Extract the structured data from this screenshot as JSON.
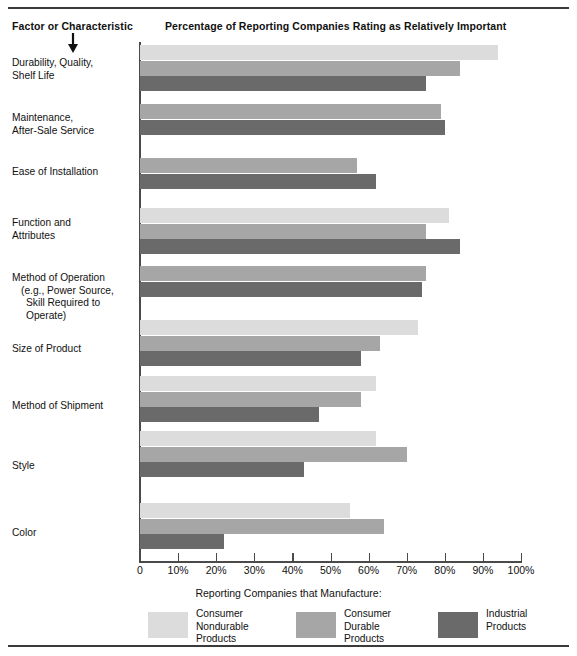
{
  "headers": {
    "factor": "Factor or Characteristic",
    "percentage": "Percentage of Reporting Companies Rating as Relatively Important"
  },
  "legend": {
    "title": "Reporting Companies that Manufacture:",
    "items": [
      {
        "label": "Consumer\nNondurable\nProducts",
        "color": "#dcdcdc",
        "key": "consumer-nondurable"
      },
      {
        "label": "Consumer\nDurable\nProducts",
        "color": "#a6a6a6",
        "key": "consumer-durable"
      },
      {
        "label": "Industrial\nProducts",
        "color": "#6a6a6a",
        "key": "industrial"
      }
    ]
  },
  "axis": {
    "ticks": [
      "0",
      "10%",
      "20%",
      "30%",
      "40%",
      "50%",
      "60%",
      "70%",
      "80%",
      "90%",
      "100%"
    ]
  },
  "chart_data": {
    "type": "bar",
    "orientation": "horizontal",
    "title": "Percentage of Reporting Companies Rating as Relatively Important",
    "xlabel": "Reporting Companies that Manufacture:",
    "ylabel": "Factor or Characteristic",
    "xlim": [
      0,
      100
    ],
    "grid": false,
    "legend_position": "bottom",
    "categories": [
      "Durability, Quality, Shelf Life",
      "Maintenance, After-Sale Service",
      "Ease of Installation",
      "Function and Attributes",
      "Method of Operation (e.g., Power Source, Skill Required to Operate)",
      "Size of Product",
      "Method of Shipment",
      "Style",
      "Color"
    ],
    "category_lines": [
      [
        "Durability, Quality,",
        "Shelf Life"
      ],
      [
        "Maintenance,",
        "After-Sale Service"
      ],
      [
        "Ease of Installation"
      ],
      [
        "Function and",
        "Attributes"
      ],
      [
        "Method of Operation",
        "(e.g., Power Source,",
        "Skill Required to Operate)"
      ],
      [
        "Size of Product"
      ],
      [
        "Method of Shipment"
      ],
      [
        "Style"
      ],
      [
        "Color"
      ]
    ],
    "series": [
      {
        "name": "Consumer Nondurable Products",
        "color": "#dcdcdc",
        "values": [
          94,
          null,
          null,
          81,
          null,
          73,
          62,
          62,
          55
        ]
      },
      {
        "name": "Consumer Durable Products",
        "color": "#a6a6a6",
        "values": [
          84,
          79,
          57,
          75,
          75,
          63,
          58,
          70,
          64
        ]
      },
      {
        "name": "Industrial Products",
        "color": "#6a6a6a",
        "values": [
          75,
          80,
          62,
          84,
          74,
          58,
          47,
          43,
          22
        ]
      }
    ]
  }
}
